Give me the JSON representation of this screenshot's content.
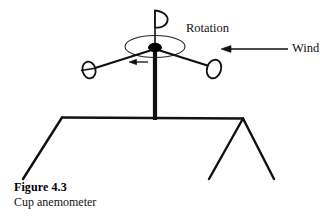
{
  "figure": {
    "title": "Figure 4.3",
    "caption": "Cup anemometer"
  },
  "annotations": {
    "rotation_label": "Rotation",
    "wind_label": "Wind"
  },
  "colors": {
    "ink": "#111111",
    "background": "#ffffff",
    "hub_fill": "#000000",
    "cup_fill": "#ffffff"
  },
  "diagram": {
    "parts": [
      {
        "name": "vertical-mast",
        "label": "Vertical mast"
      },
      {
        "name": "rotor-hub",
        "label": "Rotor hub"
      },
      {
        "name": "cup-top",
        "label": "Top cup"
      },
      {
        "name": "cup-left",
        "label": "Left cup"
      },
      {
        "name": "cup-right",
        "label": "Right cup"
      },
      {
        "name": "rotation-ellipse",
        "label": "Rotation path"
      },
      {
        "name": "rotation-arrow",
        "label": "Rotation direction arrow"
      },
      {
        "name": "wind-arrow",
        "label": "Wind direction arrow"
      },
      {
        "name": "tripod-legs",
        "label": "Tripod support legs"
      }
    ]
  }
}
